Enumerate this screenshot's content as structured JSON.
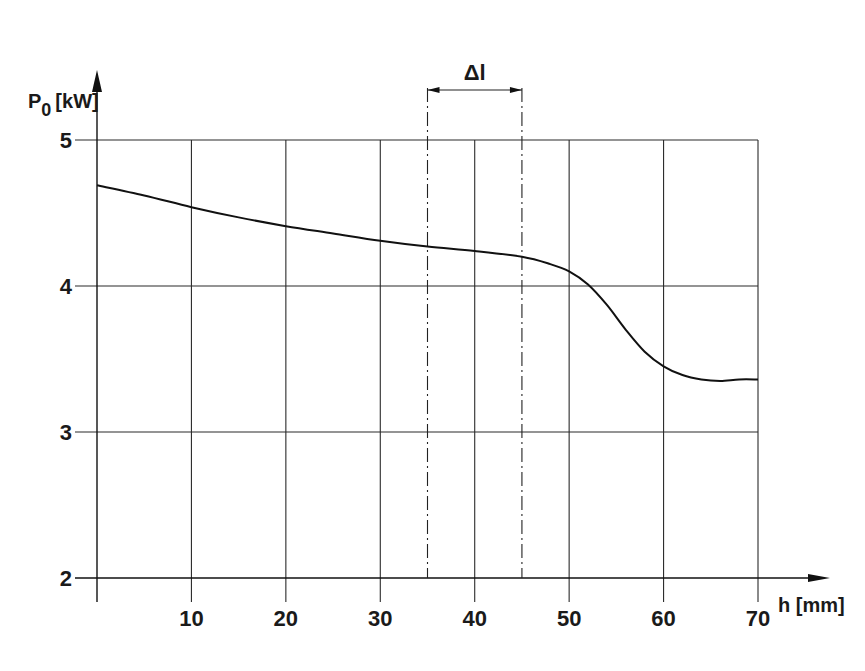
{
  "chart_data": {
    "type": "line",
    "title": "",
    "xlabel": "h [mm]",
    "ylabel": "P0 [kW]",
    "ylabel_main": "P",
    "ylabel_sub": "0",
    "ylabel_unit": "[kW]",
    "xlim": [
      0,
      70
    ],
    "ylim": [
      2,
      5
    ],
    "x_ticks": [
      10,
      20,
      30,
      40,
      50,
      60,
      70
    ],
    "y_ticks": [
      2,
      3,
      4,
      5
    ],
    "grid": true,
    "legend": null,
    "series": [
      {
        "name": "P0",
        "x": [
          0,
          5,
          10,
          15,
          20,
          25,
          30,
          35,
          40,
          45,
          48,
          50,
          52,
          54,
          56,
          58,
          60,
          62,
          64,
          66,
          68,
          70
        ],
        "values": [
          4.69,
          4.62,
          4.54,
          4.47,
          4.41,
          4.36,
          4.31,
          4.27,
          4.24,
          4.2,
          4.15,
          4.1,
          4.01,
          3.87,
          3.7,
          3.55,
          3.45,
          3.39,
          3.36,
          3.35,
          3.36,
          3.36
        ]
      }
    ],
    "annotations": [
      {
        "label": "Δl",
        "type": "dimension-interval",
        "x_start": 35,
        "x_end": 45,
        "style": "dash-dot vertical lines with double arrow"
      }
    ]
  }
}
